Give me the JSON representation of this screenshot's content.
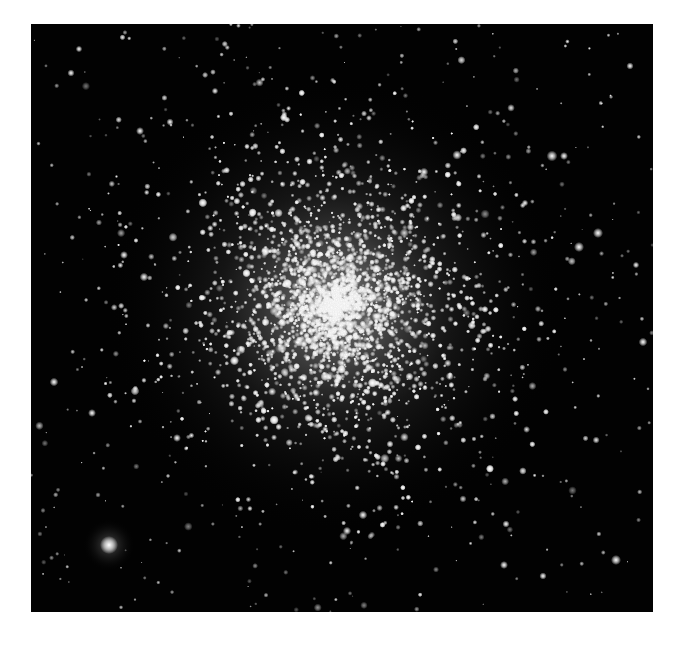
{
  "image": {
    "subject": "globular star cluster",
    "frame": {
      "x": 31,
      "y": 24,
      "width": 622,
      "height": 588
    },
    "background_color": "#020202",
    "page_background": "#ffffff"
  },
  "cluster": {
    "center": [
      335,
      305
    ],
    "core_radius": 95,
    "halo_radius": 230,
    "core_color": "#d8d8d8",
    "glow_color": "#bdbdbd",
    "star_count": 5200
  },
  "field": {
    "star_count": 420,
    "star_color": "#f2f2f2"
  },
  "bright_stars": [
    {
      "x": 109,
      "y": 545,
      "r": 5,
      "halo": 26
    },
    {
      "x": 552,
      "y": 156,
      "r": 3,
      "halo": 0
    },
    {
      "x": 564,
      "y": 156,
      "r": 2.2,
      "halo": 0
    },
    {
      "x": 598,
      "y": 233,
      "r": 2.8,
      "halo": 0
    },
    {
      "x": 579,
      "y": 247,
      "r": 2.8,
      "halo": 0
    },
    {
      "x": 457,
      "y": 155,
      "r": 2.6,
      "halo": 0
    },
    {
      "x": 424,
      "y": 172,
      "r": 2.4,
      "haloogle": 0
    },
    {
      "x": 144,
      "y": 277,
      "r": 2.4,
      "halo": 0
    },
    {
      "x": 124,
      "y": 255,
      "r": 2.2,
      "halo": 0
    },
    {
      "x": 54,
      "y": 382,
      "r": 2.4,
      "halo": 0
    },
    {
      "x": 92,
      "y": 413,
      "r": 2.2,
      "halo": 0
    },
    {
      "x": 177,
      "y": 438,
      "r": 2.2,
      "halo": 0
    },
    {
      "x": 363,
      "y": 515,
      "r": 2.4,
      "halo": 0
    },
    {
      "x": 504,
      "y": 565,
      "r": 2.2,
      "halo": 0
    },
    {
      "x": 543,
      "y": 576,
      "r": 2.0,
      "halo": 0
    },
    {
      "x": 616,
      "y": 560,
      "r": 2.8,
      "halo": 0
    },
    {
      "x": 506,
      "y": 524,
      "r": 2.0,
      "halo": 0
    },
    {
      "x": 71,
      "y": 73,
      "r": 2.0,
      "halo": 0
    },
    {
      "x": 79,
      "y": 49,
      "r": 1.8,
      "halo": 0
    },
    {
      "x": 170,
      "y": 122,
      "r": 2.0,
      "halo": 0
    },
    {
      "x": 140,
      "y": 131,
      "r": 2.2,
      "halo": 0
    },
    {
      "x": 215,
      "y": 91,
      "r": 1.8,
      "halo": 0
    },
    {
      "x": 630,
      "y": 66,
      "r": 2.0,
      "halo": 0
    },
    {
      "x": 525,
      "y": 203,
      "r": 1.8,
      "halo": 0
    },
    {
      "x": 636,
      "y": 265,
      "r": 1.8,
      "halo": 0
    },
    {
      "x": 643,
      "y": 342,
      "r": 2.4,
      "halo": 0
    }
  ]
}
